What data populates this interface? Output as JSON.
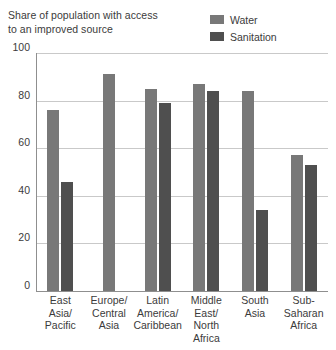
{
  "chart_data": {
    "type": "bar",
    "title": "Share of population with access to an improved source",
    "xlabel": "",
    "ylabel": "",
    "ylim": [
      0,
      100
    ],
    "yticks": [
      100,
      80,
      60,
      40,
      20,
      0
    ],
    "grid": true,
    "legend_position": "top-right",
    "categories": [
      "East Asia/ Pacific",
      "Europe/ Central Asia",
      "Latin America/ Caribbean",
      "Middle East/ North Africa",
      "South Asia",
      "Sub-Saharan Africa"
    ],
    "category_lines": [
      [
        "East",
        "Asia/",
        "Pacific"
      ],
      [
        "Europe/",
        "Central",
        "Asia"
      ],
      [
        "Latin",
        "America/",
        "Caribbean"
      ],
      [
        "Middle",
        "East/",
        "North",
        "Africa"
      ],
      [
        "South",
        "Asia"
      ],
      [
        "Sub-",
        "Saharan",
        "Africa"
      ]
    ],
    "series": [
      {
        "name": "Water",
        "color": "#787878",
        "values": [
          76,
          91,
          85,
          87,
          84,
          57
        ]
      },
      {
        "name": "Sanitation",
        "color": "#4f4f4f",
        "values": [
          46,
          null,
          79,
          84,
          34,
          53
        ]
      }
    ]
  },
  "legend": {
    "items": [
      {
        "label": "Water",
        "color": "#787878"
      },
      {
        "label": "Sanitation",
        "color": "#4f4f4f"
      }
    ]
  },
  "title": {
    "line1": "Share of population with access",
    "line2": "to an improved source"
  },
  "axis": {
    "ytick_labels": [
      "100",
      "80",
      "60",
      "40",
      "20",
      "0"
    ]
  }
}
